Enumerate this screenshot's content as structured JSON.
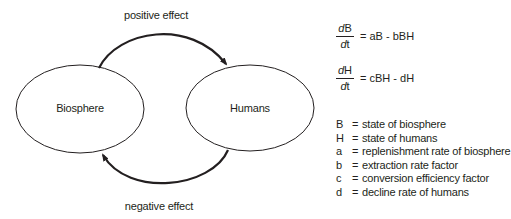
{
  "diagram": {
    "nodes": [
      {
        "id": "biosphere",
        "label": "Biosphere"
      },
      {
        "id": "humans",
        "label": "Humans"
      }
    ],
    "edges": [
      {
        "from": "biosphere",
        "to": "humans",
        "label": "positive effect"
      },
      {
        "from": "humans",
        "to": "biosphere",
        "label": "negative effect"
      }
    ]
  },
  "equations": [
    {
      "numerator_d": "d",
      "numerator_var": "B",
      "denominator_d": "d",
      "denominator_var": "t",
      "rhs": "= aB - bBH"
    },
    {
      "numerator_d": "d",
      "numerator_var": "H",
      "denominator_d": "d",
      "denominator_var": "t",
      "rhs": "= cBH - dH"
    }
  ],
  "legend": [
    {
      "symbol": "B",
      "eq": "=",
      "description": "state of biosphere"
    },
    {
      "symbol": "H",
      "eq": "=",
      "description": "state of humans"
    },
    {
      "symbol": "a",
      "eq": "=",
      "description": "replenishment rate of biosphere"
    },
    {
      "symbol": "b",
      "eq": "=",
      "description": "extraction rate factor"
    },
    {
      "symbol": "c",
      "eq": "=",
      "description": "conversion efficiency factor"
    },
    {
      "symbol": "d",
      "eq": "=",
      "description": "decline rate of humans"
    }
  ],
  "colors": {
    "ink": "#231f20",
    "background": "#ffffff"
  }
}
